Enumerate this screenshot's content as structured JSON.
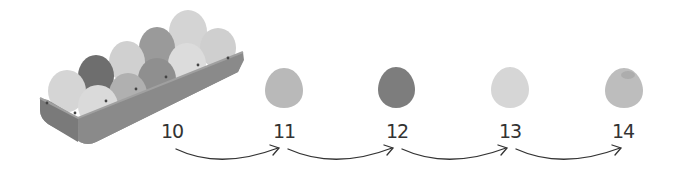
{
  "tray": {
    "egg_count": 10,
    "label": "egg carton with ten eggs"
  },
  "numbers": [
    "10",
    "11",
    "12",
    "13",
    "14"
  ],
  "single_eggs": [
    {
      "number": "11",
      "color": "#b9b9b9"
    },
    {
      "number": "12",
      "color": "#7d7d7d"
    },
    {
      "number": "13",
      "color": "#d6d6d6"
    },
    {
      "number": "14",
      "color": "#bdbdbd"
    }
  ],
  "colors": {
    "tray": "#8c8c8c",
    "tray_dark": "#6f6f6f",
    "arrow": "#333333",
    "text": "#333333"
  }
}
